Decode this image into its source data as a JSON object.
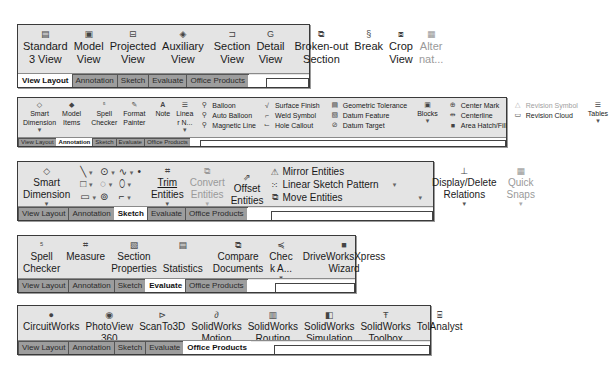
{
  "tabs": [
    "View Layout",
    "Annotation",
    "Sketch",
    "Evaluate",
    "Office Products"
  ],
  "panels": {
    "view_layout": {
      "active_tab": "View Layout",
      "buttons": [
        {
          "label1": "Standard",
          "label2": "3 View",
          "icon": "standard-3-view-icon",
          "glyph": "▤"
        },
        {
          "label1": "Model",
          "label2": "View",
          "icon": "model-view-icon",
          "glyph": "▣"
        },
        {
          "label1": "Projected",
          "label2": "View",
          "icon": "projected-view-icon",
          "glyph": "⊟"
        },
        {
          "label1": "Auxiliary",
          "label2": "View",
          "icon": "auxiliary-view-icon",
          "glyph": "◈"
        },
        {
          "label1": "Section",
          "label2": "View",
          "icon": "section-view-icon",
          "glyph": "⊐"
        },
        {
          "label1": "Detail",
          "label2": "View",
          "icon": "detail-view-icon",
          "glyph": "G"
        },
        {
          "label1": "Broken-out",
          "label2": "Section",
          "icon": "broken-out-section-icon",
          "glyph": "⧉"
        },
        {
          "label1": "Break",
          "label2": "",
          "icon": "break-icon",
          "glyph": "§"
        },
        {
          "label1": "Crop",
          "label2": "View",
          "icon": "crop-view-icon",
          "glyph": "⧈"
        },
        {
          "label1": "Alter",
          "label2": "nat...",
          "icon": "alternate-position-icon",
          "glyph": "▦",
          "disabled": true
        }
      ]
    },
    "annotation": {
      "active_tab": "Annotation",
      "buttons_left": [
        {
          "label1": "Smart",
          "label2": "Dimension",
          "caret": true,
          "glyph": "◇"
        },
        {
          "label1": "Model",
          "label2": "Items",
          "glyph": "◆"
        },
        {
          "label1": "Spell",
          "label2": "Checker",
          "glyph": "⁵"
        },
        {
          "label1": "Format",
          "label2": "Painter",
          "glyph": "✎"
        },
        {
          "label1": "Note",
          "label2": "",
          "glyph": "A"
        },
        {
          "label1": "Linea",
          "label2": "r N...",
          "caret": true,
          "glyph": "☰"
        }
      ],
      "list1": [
        "Balloon",
        "Auto Balloon",
        "Magnetic Line"
      ],
      "list2": [
        "Surface Finish",
        "Weld Symbol",
        "Hole Callout"
      ],
      "list3": [
        "Geometric Tolerance",
        "Datum Feature",
        "Datum Target"
      ],
      "blocks": {
        "label": "Blocks"
      },
      "list4": [
        "Center Mark",
        "Centerline",
        "Area Hatch/Fill"
      ],
      "list5": [
        {
          "label": "Revision Symbol",
          "disabled": true
        },
        {
          "label": "Revision Cloud",
          "disabled": false
        }
      ],
      "tables": {
        "label": "Tables"
      }
    },
    "sketch": {
      "active_tab": "Sketch",
      "smart_dimension": {
        "label1": "Smart",
        "label2": "Dimension"
      },
      "trim": {
        "label1": "Trim",
        "label2": "Entities"
      },
      "convert": {
        "label1": "Convert",
        "label2": "Entities"
      },
      "offset": {
        "label1": "Offset",
        "label2": "Entities"
      },
      "list": [
        "Mirror Entities",
        "Linear Sketch Pattern",
        "Move Entities"
      ],
      "relations": {
        "label1": "Display/Delete",
        "label2": "Relations"
      },
      "quick_snaps": {
        "label1": "Quick",
        "label2": "Snaps"
      }
    },
    "evaluate": {
      "active_tab": "Evaluate",
      "buttons": [
        {
          "label1": "Spell",
          "label2": "Checker",
          "glyph": "⁵"
        },
        {
          "label1": "Measure",
          "label2": "",
          "glyph": "⌗"
        },
        {
          "label1": "Section",
          "label2": "Properties",
          "glyph": "▧"
        },
        {
          "label1": "",
          "label2": "Statistics",
          "glyph": "▤"
        },
        {
          "label1": "Compare",
          "label2": "Documents",
          "glyph": "⧉"
        },
        {
          "label1": "Chec",
          "label2": "k A...",
          "glyph": "≼",
          "caret": true
        },
        {
          "label1": "DriveWorksXpress",
          "label2": "Wizard",
          "glyph": "■"
        }
      ]
    },
    "office_products": {
      "active_tab": "Office Products",
      "buttons": [
        {
          "label1": "CircuitWorks",
          "label2": "",
          "glyph": "●"
        },
        {
          "label1": "PhotoView",
          "label2": "360",
          "glyph": "◉"
        },
        {
          "label1": "ScanTo3D",
          "label2": "",
          "glyph": "⊳"
        },
        {
          "label1": "SolidWorks",
          "label2": "Motion",
          "glyph": "∂"
        },
        {
          "label1": "SolidWorks",
          "label2": "Routing",
          "glyph": "▥"
        },
        {
          "label1": "SolidWorks",
          "label2": "Simulation",
          "glyph": "◧"
        },
        {
          "label1": "SolidWorks",
          "label2": "Toolbox",
          "glyph": "Ŧ"
        },
        {
          "label1": "TolAnalyst",
          "label2": "",
          "glyph": "⌸"
        }
      ]
    }
  }
}
